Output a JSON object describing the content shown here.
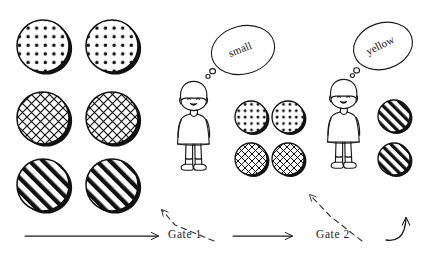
{
  "figure": {
    "type": "diagram",
    "title": "",
    "style": "hand-drawn sketch, black ink on white"
  },
  "labels": {
    "gate1": "Gate 1",
    "gate2": "Gate 2"
  },
  "thought_bubbles": [
    {
      "id": "bubble-small",
      "word": "small",
      "speaker": "girl-1"
    },
    {
      "id": "bubble-yellow",
      "word": "yellow",
      "speaker": "girl-2"
    }
  ],
  "groups": [
    {
      "id": "input-set",
      "name": "input-circle-grid",
      "columns": 2,
      "rows": 3,
      "radius": 26,
      "items": [
        {
          "pattern": "dots",
          "cx": 43,
          "cy": 46
        },
        {
          "pattern": "dots",
          "cx": 112,
          "cy": 46
        },
        {
          "pattern": "crosshatch",
          "cx": 43,
          "cy": 118
        },
        {
          "pattern": "crosshatch",
          "cx": 112,
          "cy": 118
        },
        {
          "pattern": "diagonal",
          "cx": 43,
          "cy": 185
        },
        {
          "pattern": "diagonal",
          "cx": 112,
          "cy": 185
        }
      ]
    },
    {
      "id": "middle-set",
      "name": "after-gate1-circle-grid",
      "columns": 2,
      "rows": 2,
      "radius": 16,
      "items": [
        {
          "pattern": "dots",
          "cx": 251,
          "cy": 117
        },
        {
          "pattern": "dots",
          "cx": 288,
          "cy": 117
        },
        {
          "pattern": "crosshatch",
          "cx": 251,
          "cy": 159
        },
        {
          "pattern": "crosshatch",
          "cx": 288,
          "cy": 159
        }
      ]
    },
    {
      "id": "output-set",
      "name": "after-gate2-circle-column",
      "columns": 1,
      "rows": 2,
      "radius": 16,
      "items": [
        {
          "pattern": "diagonal",
          "cx": 394,
          "cy": 116
        },
        {
          "pattern": "diagonal",
          "cx": 394,
          "cy": 159
        }
      ]
    }
  ],
  "people": [
    {
      "id": "girl-1",
      "name": "girl-figure-gate1",
      "x": 192,
      "y": 82
    },
    {
      "id": "girl-2",
      "name": "girl-figure-gate2",
      "x": 342,
      "y": 80
    }
  ],
  "arrows": [
    {
      "id": "flow-1",
      "name": "flow-arrow-1",
      "kind": "solid-straight",
      "from": [
        25,
        236
      ],
      "to": [
        162,
        236
      ]
    },
    {
      "id": "flow-2",
      "name": "flow-arrow-2",
      "kind": "solid-straight",
      "from": [
        233,
        236
      ],
      "to": [
        296,
        236
      ]
    },
    {
      "id": "point-1",
      "name": "gate1-pointer",
      "kind": "dashed-elbow",
      "from": [
        214,
        240
      ],
      "to": [
        160,
        206
      ]
    },
    {
      "id": "point-2",
      "name": "gate2-pointer",
      "kind": "dashed-elbow",
      "from": [
        362,
        240
      ],
      "to": [
        308,
        190
      ]
    },
    {
      "id": "flow-3",
      "name": "flow-arrow-curved-out",
      "kind": "solid-curved",
      "from": [
        386,
        240
      ],
      "to": [
        412,
        212
      ]
    }
  ],
  "colors": {
    "ink": "#1a1a1a",
    "paper": "#ffffff",
    "shadow": "#111111"
  }
}
